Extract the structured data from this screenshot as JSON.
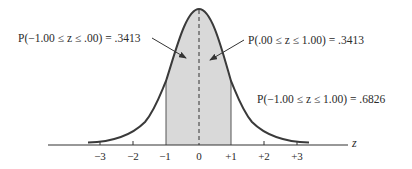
{
  "diagram": {
    "title": "",
    "annotations": [
      {
        "id": "left",
        "text": "P(−1.00 ≤ z ≤ .00) = .3413"
      },
      {
        "id": "right",
        "text": "P(.00 ≤ z ≤ 1.00) = .3413"
      },
      {
        "id": "total",
        "text": "P(−1.00 ≤ z ≤ 1.00) = .6826"
      }
    ],
    "axis": {
      "name": "z",
      "ticks": [
        "−3",
        "−2",
        "−1",
        "0",
        "+1",
        "+2",
        "+3"
      ]
    },
    "shaded_region": {
      "from": -1,
      "to": 1,
      "area": 0.6826
    },
    "colors": {
      "curve": "#3a3a3a",
      "shade": "#d9d9d9",
      "text": "#2a2a2a"
    }
  }
}
